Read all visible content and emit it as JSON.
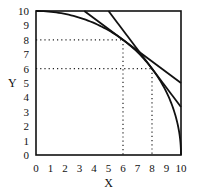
{
  "chart_data": {
    "type": "line",
    "title": "",
    "xlabel": "X",
    "ylabel": "Y",
    "xlim": [
      0,
      10
    ],
    "ylim": [
      0,
      10
    ],
    "xticks": [
      0,
      1,
      2,
      3,
      4,
      5,
      6,
      7,
      8,
      9,
      10
    ],
    "yticks": [
      0,
      1,
      2,
      3,
      4,
      5,
      6,
      7,
      8,
      9,
      10
    ],
    "grid": false,
    "series": [
      {
        "name": "curve x^2 + y^2 = 100",
        "kind": "quarter-circle",
        "points": [
          [
            0,
            10
          ],
          [
            6,
            8
          ],
          [
            8,
            6
          ],
          [
            10,
            0
          ]
        ]
      },
      {
        "name": "tangent at (6,8)",
        "kind": "line",
        "points": [
          [
            3.33,
            10
          ],
          [
            10,
            5
          ]
        ]
      },
      {
        "name": "tangent at (8,6)",
        "kind": "line",
        "points": [
          [
            5,
            10
          ],
          [
            10,
            3.33
          ]
        ]
      }
    ],
    "annotations": [
      {
        "type": "dotted-guide",
        "point": [
          6,
          8
        ]
      },
      {
        "type": "dotted-guide",
        "point": [
          8,
          6
        ]
      }
    ]
  },
  "labels": {
    "x": "X",
    "y": "Y"
  }
}
